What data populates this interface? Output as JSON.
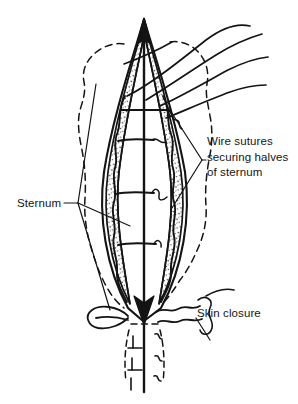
{
  "figure": {
    "background_color": "#ffffff",
    "ink_color": "#141414",
    "width": 298,
    "height": 404
  },
  "labels": {
    "wire_sutures": {
      "line1": "Wire sutures",
      "line2": "securing halves",
      "line3": "of sternum"
    },
    "sternum": "Sternum",
    "skin_closure": "Skin closure"
  },
  "anatomy": {
    "midline_label": "sternal midline",
    "top_apex_label": "superior sternal apex",
    "bottom_apex_label": "inferior sternal apex (xiphoid)",
    "left_half_label": "left sternal half",
    "right_half_label": "right sternal half",
    "skin_outline_label": "skin and soft tissue outline (dashed)"
  },
  "wire_sutures": {
    "count": 4,
    "positions_label": [
      "upper",
      "upper-mid",
      "lower-mid",
      "lower"
    ],
    "free_strands": 4
  },
  "skin_closure": {
    "stitch_count": 5,
    "loop_label": "suture loop"
  },
  "leaders": {
    "wire_sutures_bracket": "bracket pointing to right sternal edge",
    "sternum_bracket": "bracket pointing to left sternal edge",
    "skin_closure_leader": "leader to skin suture line"
  }
}
